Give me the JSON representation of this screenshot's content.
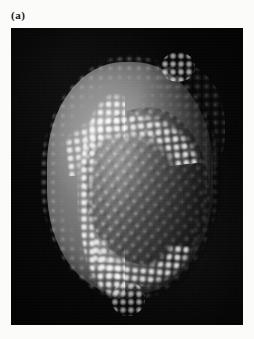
{
  "figure": {
    "panel_label": "(a)",
    "background_color": "#fbfbfa",
    "plate": {
      "background_color": "#050505",
      "content_type": "space-filling molecular surface rendering",
      "subject": "icosahedral virus capsid particle",
      "features": {
        "lattice": "ordered array of capsomere subunits on the front face",
        "bright_band": "band of white-highlighted protein subunits arcing across the upper surface and down the left flank",
        "dark_flank": "shadowed right-hand limb of the particle",
        "rim": "granular rough rim of individual atoms around the silhouette"
      },
      "palette": {
        "particle_midtone": "#7c7c7c",
        "particle_highlight": "#ffffff",
        "particle_shadow": "#202020",
        "field": "#050505"
      }
    }
  }
}
